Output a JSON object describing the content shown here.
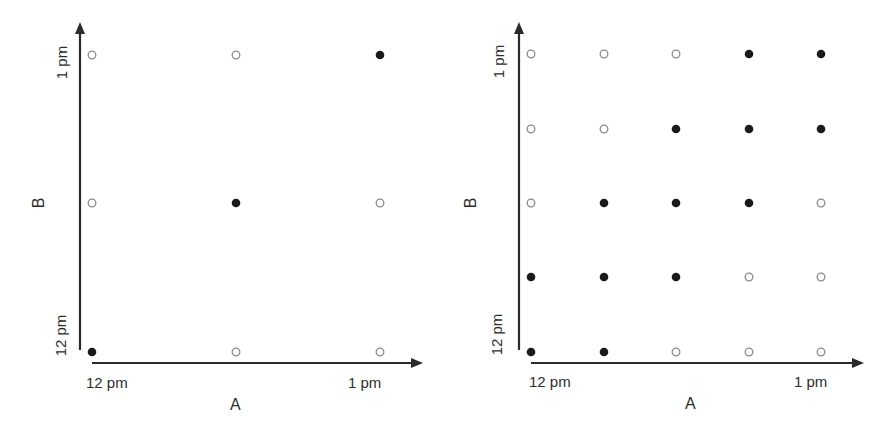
{
  "chart_data": [
    {
      "type": "scatter",
      "title": "",
      "xlabel": "A",
      "ylabel": "B",
      "x_tick_labels": [
        "12 pm",
        "1 pm"
      ],
      "y_tick_labels": [
        "12 pm",
        "1 pm"
      ],
      "grid_size": 3,
      "grid": [
        [
          0,
          0,
          1
        ],
        [
          0,
          1,
          0
        ],
        [
          1,
          0,
          0
        ]
      ],
      "grid_row_order": "top-to-bottom (1 pm at top, 12 pm at bottom)",
      "legend": {
        "filled": "filled dot",
        "open": "open dot"
      }
    },
    {
      "type": "scatter",
      "title": "",
      "xlabel": "A",
      "ylabel": "B",
      "x_tick_labels": [
        "12 pm",
        "1 pm"
      ],
      "y_tick_labels": [
        "12 pm",
        "1 pm"
      ],
      "grid_size": 5,
      "grid": [
        [
          0,
          0,
          0,
          1,
          1
        ],
        [
          0,
          0,
          1,
          1,
          1
        ],
        [
          0,
          1,
          1,
          1,
          0
        ],
        [
          1,
          1,
          1,
          0,
          0
        ],
        [
          1,
          1,
          0,
          0,
          0
        ]
      ],
      "grid_row_order": "top-to-bottom (1 pm at top, 12 pm at bottom)"
    }
  ],
  "colors": {
    "axis": "#2a2a2a",
    "filled_dot": "#1a1a1a",
    "open_dot_stroke": "#8a8a8a"
  },
  "panels": [
    {
      "x_axis_label": "A",
      "y_axis_label": "B",
      "x_tick_start": "12 pm",
      "x_tick_end": "1 pm",
      "y_tick_start": "12 pm",
      "y_tick_end": "1 pm"
    },
    {
      "x_axis_label": "A",
      "y_axis_label": "B",
      "x_tick_start": "12 pm",
      "x_tick_end": "1 pm",
      "y_tick_start": "12 pm",
      "y_tick_end": "1 pm"
    }
  ]
}
